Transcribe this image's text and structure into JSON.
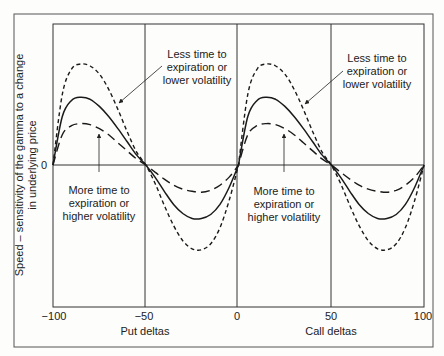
{
  "chart_data": {
    "type": "line",
    "title": "",
    "xlabel_left": "Put deltas",
    "xlabel_right": "Call deltas",
    "ylabel": "Speed – sensitivity of the gamma to a change in underlying price",
    "ylabel_lines": [
      "Speed – sensitivity of the gamma to a change",
      "in underlying price"
    ],
    "x_ticks": [
      -100,
      -50,
      0,
      50,
      100
    ],
    "x_tick_labels": [
      "−100",
      "−50",
      "0",
      "50",
      "100"
    ],
    "y_ticks": [
      0
    ],
    "y_tick_labels": [
      "0"
    ],
    "xlim": [
      -100,
      100
    ],
    "ylim": [
      -1.4,
      1.4
    ],
    "grid": "vertical lines at -50, 0, 50; horizontal zero line",
    "legend": "none (annotations used)",
    "x": [
      -100,
      -95,
      -90,
      -85,
      -80,
      -75,
      -70,
      -65,
      -60,
      -55,
      -50,
      -45,
      -40,
      -35,
      -30,
      -25,
      -20,
      -15,
      -10,
      -5,
      0,
      5,
      10,
      15,
      20,
      25,
      30,
      35,
      40,
      45,
      50,
      55,
      60,
      65,
      70,
      75,
      80,
      85,
      90,
      95,
      100
    ],
    "series": [
      {
        "name": "Less time to expiration or lower volatility",
        "style": "short-dash",
        "values": [
          0,
          0.7,
          0.95,
          1.0,
          0.98,
          0.9,
          0.75,
          0.55,
          0.33,
          0.13,
          0,
          -0.18,
          -0.4,
          -0.6,
          -0.75,
          -0.83,
          -0.84,
          -0.78,
          -0.62,
          -0.35,
          0,
          0.7,
          0.95,
          1.0,
          0.98,
          0.9,
          0.75,
          0.55,
          0.33,
          0.13,
          0,
          -0.18,
          -0.4,
          -0.6,
          -0.75,
          -0.83,
          -0.84,
          -0.78,
          -0.62,
          -0.35,
          0
        ]
      },
      {
        "name": "Base case",
        "style": "solid",
        "values": [
          0,
          0.48,
          0.64,
          0.67,
          0.65,
          0.58,
          0.48,
          0.36,
          0.23,
          0.1,
          0,
          -0.12,
          -0.26,
          -0.39,
          -0.48,
          -0.53,
          -0.53,
          -0.49,
          -0.39,
          -0.22,
          0,
          0.48,
          0.64,
          0.67,
          0.65,
          0.58,
          0.48,
          0.36,
          0.23,
          0.1,
          0,
          -0.12,
          -0.26,
          -0.39,
          -0.48,
          -0.53,
          -0.53,
          -0.49,
          -0.39,
          -0.22,
          0
        ]
      },
      {
        "name": "More time to expiration or higher volatility",
        "style": "long-dash",
        "values": [
          0,
          0.3,
          0.39,
          0.41,
          0.4,
          0.36,
          0.3,
          0.22,
          0.14,
          0.06,
          0,
          -0.07,
          -0.14,
          -0.2,
          -0.24,
          -0.26,
          -0.27,
          -0.25,
          -0.2,
          -0.12,
          0,
          0.3,
          0.39,
          0.41,
          0.4,
          0.36,
          0.3,
          0.22,
          0.14,
          0.06,
          0,
          -0.07,
          -0.14,
          -0.2,
          -0.24,
          -0.26,
          -0.27,
          -0.25,
          -0.2,
          -0.12,
          0
        ]
      }
    ],
    "annotations": [
      {
        "text": [
          "Less time to",
          "expiration or",
          "lower volatility"
        ],
        "points_to": "short-dash curve, put side"
      },
      {
        "text": [
          "Less time to",
          "expiration or",
          "lower volatility"
        ],
        "points_to": "short-dash curve, call side"
      },
      {
        "text": [
          "More time to",
          "expiration or",
          "higher volatility"
        ],
        "points_to": "long-dash curve, put side"
      },
      {
        "text": [
          "More time to",
          "expiration or",
          "higher volatility"
        ],
        "points_to": "long-dash curve, call side"
      }
    ]
  },
  "colors": {
    "line": "#1a1a1a",
    "frame": "#444444",
    "background": "#fdfdfc"
  }
}
